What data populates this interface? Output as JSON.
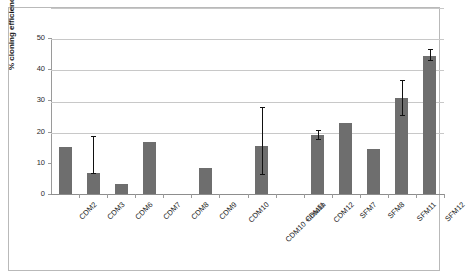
{
  "chart_data": {
    "type": "bar",
    "title": "",
    "xlabel": "",
    "ylabel": "% cloning efficiency",
    "ylim": [
      0,
      50
    ],
    "yticks": [
      0,
      10,
      20,
      30,
      40,
      50
    ],
    "grid": true,
    "legend": "none",
    "bar_color": "#6e6e6e",
    "categories": [
      "CDM2",
      "CDM3",
      "CDM6",
      "CDM7",
      "CDM8",
      "CDM9",
      "CDM10",
      "CDM10 +insulin",
      "CDM11",
      "CDM12",
      "SFM7",
      "SFM8",
      "SFM11",
      "SFM12"
    ],
    "values": [
      15.2,
      6.6,
      3.3,
      16.6,
      0,
      8.3,
      0,
      15.5,
      0,
      18.8,
      22.8,
      14.3,
      30.8,
      44.3
    ],
    "error_low": [
      null,
      6.6,
      null,
      null,
      null,
      null,
      null,
      6.5,
      null,
      17.6,
      null,
      null,
      25.2,
      42.8
    ],
    "error_high": [
      null,
      18.5,
      null,
      null,
      null,
      null,
      null,
      28.0,
      null,
      20.6,
      null,
      null,
      36.5,
      46.4
    ]
  }
}
